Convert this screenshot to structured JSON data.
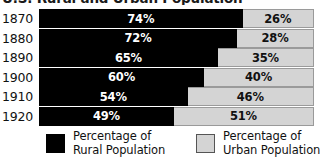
{
  "chart_data": {
    "type": "bar",
    "orientation": "horizontal",
    "stacked": true,
    "normalized_percent": true,
    "title": "U.S. Rural and Urban Population",
    "xlabel": "",
    "ylabel": "",
    "xlim": [
      0,
      100
    ],
    "grid": false,
    "legend_position": "bottom",
    "categories": [
      "1870",
      "1880",
      "1890",
      "1900",
      "1910",
      "1920"
    ],
    "series": [
      {
        "name": "Percentage of Rural Population",
        "color": "#000000",
        "values": [
          74,
          72,
          65,
          60,
          54,
          49
        ],
        "labels": [
          "74%",
          "72%",
          "65%",
          "60%",
          "54%",
          "49%"
        ]
      },
      {
        "name": "Percentage of Urban Population",
        "color": "#d4d4d4",
        "values": [
          26,
          28,
          35,
          40,
          46,
          51
        ],
        "labels": [
          "26%",
          "28%",
          "35%",
          "40%",
          "46%",
          "51%"
        ]
      }
    ]
  },
  "title": "U.S. Rural and Urban Population",
  "rows": [
    {
      "year": "1870",
      "rural": 74,
      "urban": 26,
      "rural_label": "74%",
      "urban_label": "26%"
    },
    {
      "year": "1880",
      "rural": 72,
      "urban": 28,
      "rural_label": "72%",
      "urban_label": "28%"
    },
    {
      "year": "1890",
      "rural": 65,
      "urban": 35,
      "rural_label": "65%",
      "urban_label": "35%"
    },
    {
      "year": "1900",
      "rural": 60,
      "urban": 40,
      "rural_label": "60%",
      "urban_label": "40%"
    },
    {
      "year": "1910",
      "rural": 54,
      "urban": 46,
      "rural_label": "54%",
      "urban_label": "46%"
    },
    {
      "year": "1920",
      "rural": 49,
      "urban": 51,
      "rural_label": "49%",
      "urban_label": "51%"
    }
  ],
  "legend": {
    "rural": {
      "line1": "Percentage of",
      "line2": "Rural Population",
      "color": "#000000"
    },
    "urban": {
      "line1": "Percentage of",
      "line2": "Urban Population",
      "color": "#d4d4d4"
    }
  }
}
